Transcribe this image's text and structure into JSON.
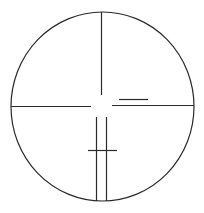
{
  "diagram": {
    "colors": {
      "background": "#ffffff",
      "line": "#2a2a2a"
    },
    "elements": [
      "outer-circle",
      "top-vertical-line",
      "left-horizontal-line",
      "right-horizontal-line",
      "right-offset-line",
      "lower-left-vertical-line",
      "lower-right-vertical-line",
      "lower-crossbar"
    ]
  }
}
